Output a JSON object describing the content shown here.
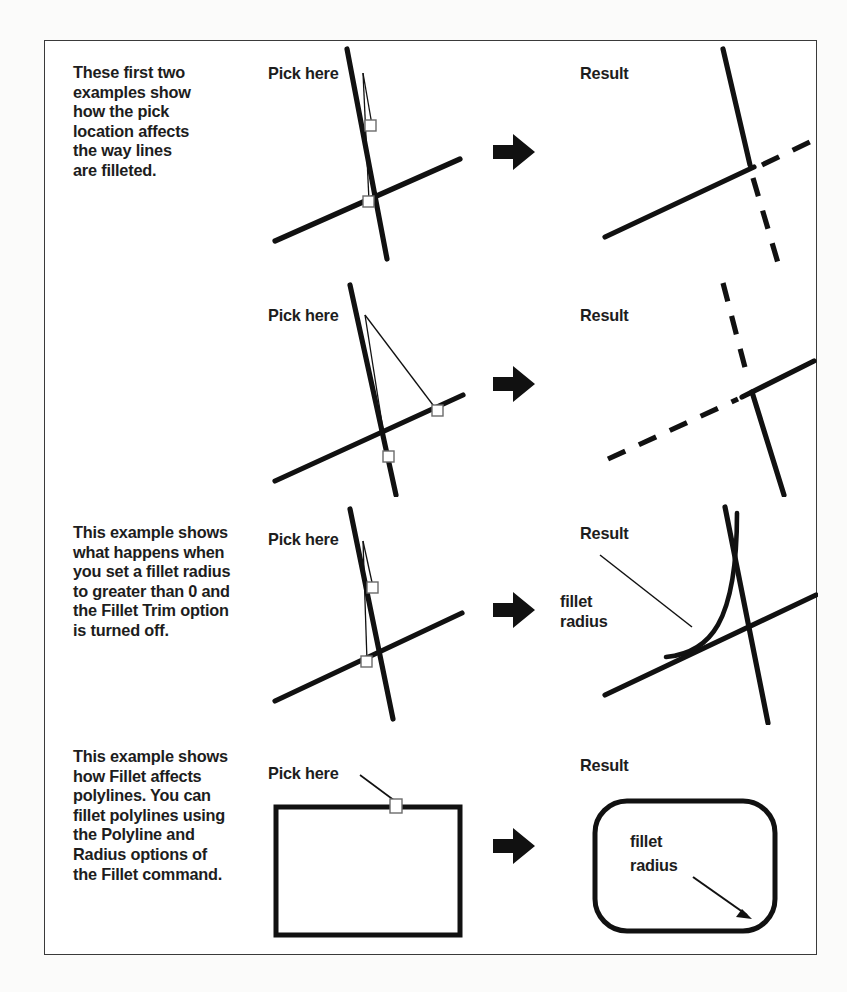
{
  "page": {
    "border_color": "#3a3a3a",
    "ink_color": "#111111",
    "background": "#ffffff"
  },
  "labels": {
    "pick_here": "Pick here",
    "result": "Result",
    "fillet_radius_line1": "fillet",
    "fillet_radius_line2": "radius"
  },
  "rows": [
    {
      "id": "row-pick-upper",
      "caption": "These first two examples show how the pick location affects the way lines are filleted.",
      "caption_lines": [
        "These first two",
        "examples show",
        "how the pick",
        "location affects",
        "the way lines",
        "are filleted."
      ],
      "pick_label": "Pick here",
      "result_label": "Result",
      "pick_count": 2,
      "pick_targets": [
        "vertical-line-above-intersection",
        "horizontal-line-left-of-intersection"
      ],
      "result_kept": [
        "vertical-upper",
        "horizontal-left"
      ],
      "result_trimmed": [
        "vertical-lower",
        "horizontal-right"
      ],
      "fillet_radius": 0
    },
    {
      "id": "row-pick-lower",
      "caption": "",
      "caption_lines": [],
      "pick_label": "Pick here",
      "result_label": "Result",
      "pick_count": 2,
      "pick_targets": [
        "horizontal-line-right-of-intersection",
        "vertical-line-below-intersection"
      ],
      "result_kept": [
        "vertical-lower",
        "horizontal-right"
      ],
      "result_trimmed": [
        "vertical-upper",
        "horizontal-left"
      ],
      "fillet_radius": 0
    },
    {
      "id": "row-fillet-no-trim",
      "caption": "This example shows what happens when you set a fillet radius to greater than 0 and the Fillet Trim option is turned off.",
      "caption_lines": [
        "This example shows",
        "what happens when",
        "you set a fillet radius",
        "to greater than 0 and",
        "the Fillet Trim option",
        "is turned off."
      ],
      "pick_label": "Pick here",
      "result_label": "Result",
      "pick_count": 2,
      "pick_targets": [
        "vertical-line-above-intersection",
        "horizontal-line-left-of-intersection"
      ],
      "annotation_lines": [
        "fillet",
        "radius"
      ],
      "result_kept": [
        "vertical-full",
        "horizontal-full",
        "fillet-arc"
      ],
      "result_trimmed": [],
      "fillet_radius": "greater than 0"
    },
    {
      "id": "row-polyline",
      "caption": "This example shows how Fillet affects polylines. You can fillet polylines using the Polyline and Radius options of the Fillet command.",
      "caption_lines": [
        "This example shows",
        "how Fillet affects",
        "polylines. You can",
        "fillet polylines using",
        "the Polyline and",
        "Radius options of",
        "the Fillet command."
      ],
      "pick_label": "Pick here",
      "result_label": "Result",
      "pick_count": 1,
      "pick_targets": [
        "rectangle-top-edge"
      ],
      "annotation_lines": [
        "fillet",
        "radius"
      ],
      "shape_before": "rectangle",
      "shape_after": "rounded-rectangle",
      "fillet_radius": "greater than 0"
    }
  ],
  "arrow": {
    "glyph": "block-right-arrow",
    "count": 4,
    "color": "#111111"
  }
}
